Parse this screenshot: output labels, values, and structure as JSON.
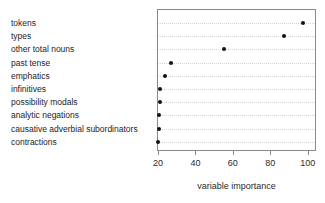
{
  "chart_data": {
    "type": "scatter",
    "variant": "cleveland-dot-plot",
    "title": "",
    "categories": [
      "tokens",
      "types",
      "other total nouns",
      "past tense",
      "emphatics",
      "infinitives",
      "possibility modals",
      "analytic negations",
      "causative adverbial subordinators",
      "contractions"
    ],
    "values": [
      97.5,
      87.3,
      55.3,
      27,
      23.7,
      20.9,
      20.8,
      20.7,
      20.6,
      19.8
    ],
    "xlabel": "variable importance",
    "ylabel": "",
    "x_ticks": [
      20,
      40,
      60,
      80,
      100
    ],
    "xlim": [
      19.5,
      104.5
    ],
    "grid": "dotted horizontal reference line per category",
    "legend": "none",
    "dot_color": "#111111",
    "gridline_color": "#d2d2d2",
    "border_color": "#8a8a8a",
    "background_color": "#ffffff"
  }
}
